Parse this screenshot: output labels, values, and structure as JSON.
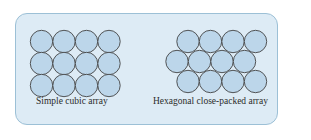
{
  "diagram": {
    "panel_color": "#ddebf5",
    "border_color": "#9cc0d6",
    "circle_fill": "#bcd6ea",
    "circle_stroke": "#444444",
    "left": {
      "label": "Simple cubic array",
      "rows": 3,
      "cols": 4
    },
    "right": {
      "label": "Hexagonal close-packed array",
      "rows": 3,
      "cols": 4
    }
  }
}
